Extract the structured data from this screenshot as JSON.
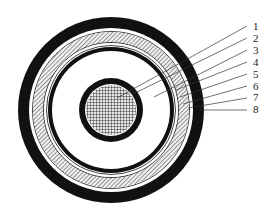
{
  "diagram": {
    "type": "cable-cross-section",
    "background": "#ffffff",
    "ink": "#111111",
    "center": [
      111,
      110
    ],
    "layers": [
      {
        "id": "outer-sheath",
        "type": "solid",
        "r_outer": 93,
        "r_inner": 82,
        "color": "#111111"
      },
      {
        "id": "gap-outer",
        "type": "white",
        "r_outer": 82,
        "r_inner": 79
      },
      {
        "id": "outer-thin-line",
        "type": "stroke",
        "r": 78.5,
        "width": 0.8
      },
      {
        "id": "metal-screen",
        "type": "hatched",
        "r_outer": 78,
        "r_inner": 68
      },
      {
        "id": "inner-thin-line",
        "type": "stroke",
        "r": 67.5,
        "width": 0.8
      },
      {
        "id": "gap-inner",
        "type": "white",
        "r_outer": 67,
        "r_inner": 65
      },
      {
        "id": "insulation-screen-line",
        "type": "stroke",
        "r": 64.5,
        "width": 0.8
      },
      {
        "id": "insulation-screen",
        "type": "solid",
        "r_outer": 63,
        "r_inner": 59,
        "color": "#111111"
      },
      {
        "id": "insulation",
        "type": "white",
        "r_outer": 59,
        "r_inner": 32
      },
      {
        "id": "conductor-screen",
        "type": "solid",
        "r_outer": 32,
        "r_inner": 26,
        "color": "#111111"
      },
      {
        "id": "conductor-gap",
        "type": "white",
        "r_outer": 26,
        "r_inner": 25
      },
      {
        "id": "conductor",
        "type": "grid",
        "r_outer": 25
      }
    ],
    "labels": [
      {
        "text": "1",
        "x": 253,
        "y": 30,
        "from": [
          247,
          26
        ],
        "to": [
          117,
          98
        ]
      },
      {
        "text": "2",
        "x": 253,
        "y": 42,
        "from": [
          247,
          38
        ],
        "to": [
          133,
          94
        ]
      },
      {
        "text": "3",
        "x": 253,
        "y": 54,
        "from": [
          247,
          50
        ],
        "to": [
          154,
          97
        ]
      },
      {
        "text": "4",
        "x": 253,
        "y": 66,
        "from": [
          247,
          62
        ],
        "to": [
          176,
          90
        ]
      },
      {
        "text": "5",
        "x": 253,
        "y": 78,
        "from": [
          247,
          74
        ],
        "to": [
          180,
          97
        ]
      },
      {
        "text": "6",
        "x": 253,
        "y": 90,
        "from": [
          247,
          86
        ],
        "to": [
          183,
          104
        ]
      },
      {
        "text": "7",
        "x": 253,
        "y": 101,
        "from": [
          247,
          98
        ],
        "to": [
          188,
          108
        ]
      },
      {
        "text": "8",
        "x": 253,
        "y": 113,
        "from": [
          247,
          110
        ],
        "to": [
          200,
          110
        ]
      }
    ]
  }
}
